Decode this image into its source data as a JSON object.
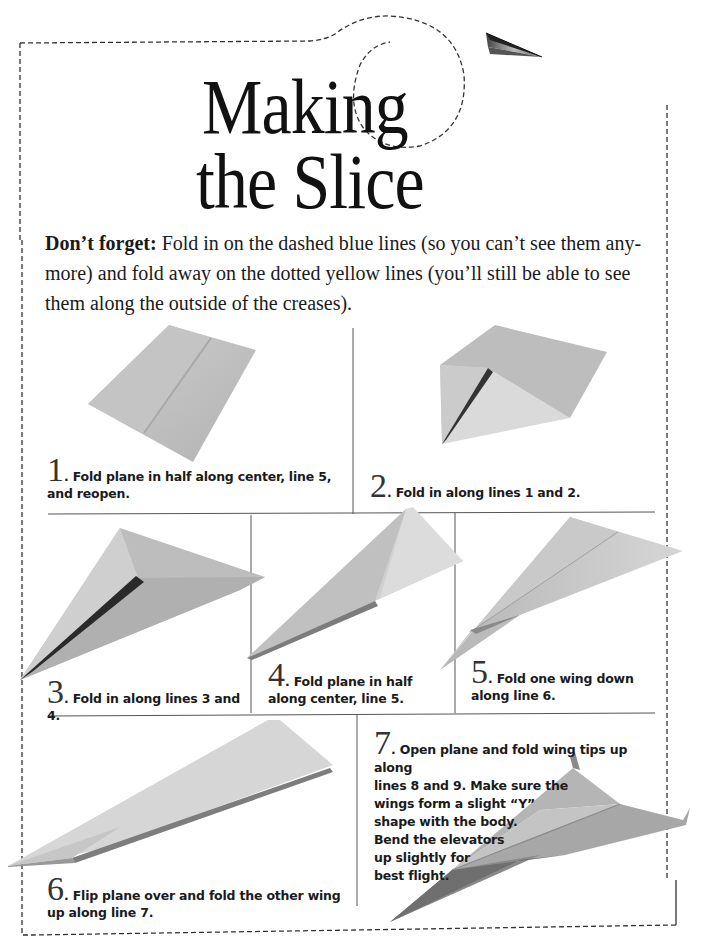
{
  "title": {
    "line1": "Making",
    "line2": "the Slice"
  },
  "intro": {
    "lead": "Don’t forget:",
    "text": " Fold in on the dashed blue lines (so you can’t see them any-more) and fold away on the dotted yellow lines (you’ll still be able to see them along the outside of the creases)."
  },
  "steps": [
    {
      "number": "1",
      "dot": ".",
      "text": " Fold plane in half along center, line 5, and reopen."
    },
    {
      "number": "2",
      "dot": ".",
      "text": " Fold in along lines 1 and 2."
    },
    {
      "number": "3",
      "dot": ".",
      "text": " Fold in along lines 3 and 4."
    },
    {
      "number": "4",
      "dot": ".",
      "text": " Fold plane in half along center, line 5."
    },
    {
      "number": "5",
      "dot": ".",
      "text": " Fold one wing down along line 6."
    },
    {
      "number": "6",
      "dot": ".",
      "text": " Flip plane over and fold the other wing up along line 7."
    },
    {
      "number": "7",
      "dot": ".",
      "text_lines": [
        " Open plane and fold wing tips up along",
        "lines 8 and 9. Make sure the",
        "wings form a slight “Y”",
        "shape with the body.",
        "Bend the elevators",
        "up slightly for",
        "best flight."
      ]
    }
  ],
  "icons": {
    "header_plane": "paper-airplane-icon",
    "border": "dashed-cut-border"
  },
  "colors": {
    "text": "#161616",
    "paper_light": "#d8d8d8",
    "paper_mid": "#b9b9b9",
    "paper_dark": "#7a7a7a",
    "grid_line": "#555555",
    "border_dash": "#333333"
  }
}
